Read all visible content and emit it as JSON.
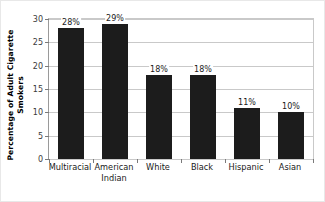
{
  "chart_data": {
    "type": "bar",
    "title": "",
    "subtitle": "",
    "xlabel": "",
    "ylabel": "Percentage of Adult Cigarette Smokers",
    "ylabel_lines": [
      "Percentage of Adult Cigarette",
      "Smokers"
    ],
    "categories": [
      "Multiracial",
      "American\nIndian",
      "White",
      "Black",
      "Hispanic",
      "Asian"
    ],
    "values": [
      28,
      29,
      18,
      18,
      11,
      10
    ],
    "data_labels": [
      "28%",
      "29%",
      "18%",
      "18%",
      "11%",
      "10%"
    ],
    "ylim": [
      0,
      30
    ],
    "ytick_values": [
      0,
      5,
      10,
      15,
      20,
      25,
      30
    ],
    "ytick_labels": [
      "0",
      "5",
      "10",
      "15",
      "20",
      "25",
      "30"
    ],
    "grid": "horizontal",
    "legend": "none",
    "series": [
      {
        "name": "Percentage of Adult Cigarette Smokers",
        "values": [
          28,
          29,
          18,
          18,
          11,
          10
        ],
        "color": "#1c1c1c"
      }
    ],
    "colors": {
      "bar": "#1c1c1c",
      "gridline": "#c9c9c9",
      "axis": "#7a7a7a",
      "text": "#1a1a1a",
      "background": "#ffffff"
    }
  }
}
